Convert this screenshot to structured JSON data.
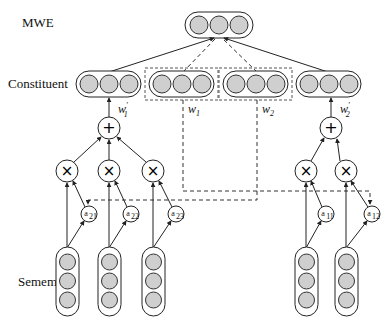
{
  "labels": {
    "mwe": "MWE",
    "constituent": "Constituent",
    "sememe": "Sememe"
  },
  "weights": {
    "w1_prime": "w",
    "w1_prime_sub": "1",
    "w2_prime": "w",
    "w2_prime_sub": "2",
    "w1": "w",
    "w1_sub": "1",
    "w2": "w",
    "w2_sub": "2",
    "prime_mark": "′"
  },
  "operators": {
    "sum": "+",
    "product": "×"
  },
  "attention": {
    "left": [
      {
        "base": "a",
        "sub": "21"
      },
      {
        "base": "a",
        "sub": "22"
      },
      {
        "base": "a",
        "sub": "23"
      }
    ],
    "right": [
      {
        "base": "a",
        "sub": "11"
      },
      {
        "base": "a",
        "sub": "12"
      }
    ]
  },
  "colors": {
    "node_fill": "#cfcfcf",
    "stroke": "#222222"
  }
}
